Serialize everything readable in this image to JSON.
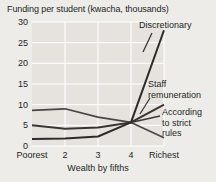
{
  "chart_data": {
    "type": "line",
    "title": "Funding per student (kwacha, thousands)",
    "xlabel": "Wealth by fifths",
    "ylabel": "",
    "categories": [
      "Poorest",
      "2",
      "3",
      "4",
      "Richest"
    ],
    "xtick_labels": [
      "Poorest",
      "2",
      "3",
      "4",
      "Richest"
    ],
    "ytick_labels": [
      "0",
      "5",
      "10",
      "15",
      "20",
      "25",
      "30"
    ],
    "yticks": [
      0,
      5,
      10,
      15,
      20,
      25,
      30
    ],
    "ylim": [
      0,
      30
    ],
    "grid": true,
    "legend": "none",
    "series": [
      {
        "name": "According to strict rules",
        "values": [
          8.6,
          9.0,
          7.0,
          5.7,
          2.0
        ]
      },
      {
        "name": "Staff remuneration",
        "values": [
          5.0,
          4.2,
          4.5,
          5.7,
          10.0
        ]
      },
      {
        "name": "Discretionary",
        "values": [
          1.7,
          1.8,
          2.3,
          5.7,
          28.0
        ]
      }
    ],
    "annotations": [
      {
        "text": "Discretionary",
        "series": "Discretionary"
      },
      {
        "text_line1": "Staff",
        "text_line2": "remuneration",
        "series": "Staff remuneration"
      },
      {
        "text_line1": "According",
        "text_line2": "to strict",
        "text_line3": "rules",
        "series": "According to strict rules"
      }
    ]
  },
  "colors": {
    "background": "#eeece9",
    "plot_background": "#e6e3df",
    "gridline": "#ffffff",
    "line": "#3a3533",
    "text": "#231f1e"
  }
}
